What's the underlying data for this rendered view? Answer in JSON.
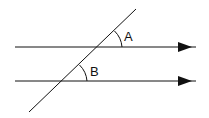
{
  "diagram": {
    "colors": {
      "stroke": "#111111",
      "background": "#ffffff"
    },
    "parallel_lines": [
      {
        "id": "top-line",
        "x1": 15,
        "y1": 47,
        "x2": 198,
        "y2": 47,
        "arrow_at": 185
      },
      {
        "id": "bottom-line",
        "x1": 15,
        "y1": 81,
        "x2": 198,
        "y2": 81,
        "arrow_at": 185
      }
    ],
    "transversal": {
      "x1": 136,
      "y1": 9,
      "x2": 29,
      "y2": 112
    },
    "angles": [
      {
        "label": "A",
        "vertex": [
          97,
          47
        ],
        "label_pos": [
          125,
          41
        ]
      },
      {
        "label": "B",
        "vertex": [
          62,
          81
        ],
        "label_pos": [
          91,
          76
        ]
      }
    ]
  }
}
